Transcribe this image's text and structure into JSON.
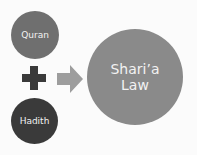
{
  "diagram": {
    "sources": [
      {
        "label": "Quran",
        "color": "#6f6f6f"
      },
      {
        "label": "Hadith",
        "color": "#3a3a3a"
      }
    ],
    "combine_symbol": "plus",
    "combine_color": "#3a3a3a",
    "arrow_color": "#9d9d9d",
    "result": {
      "label_line1": "Shari’a",
      "label_line2": "Law",
      "color": "#8a8a8a"
    }
  }
}
